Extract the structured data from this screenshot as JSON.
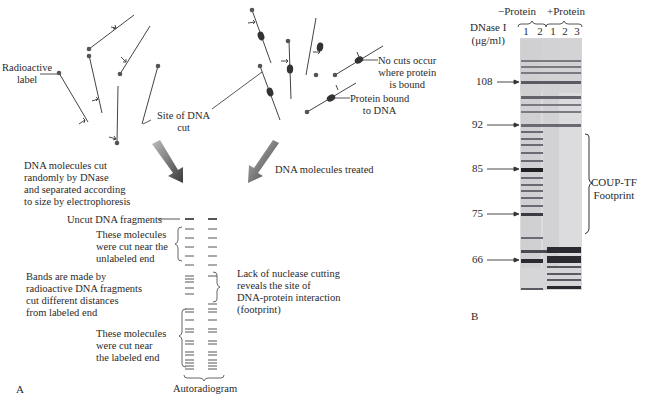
{
  "panel_a": {
    "label": "A",
    "labels": {
      "radioactive": [
        "Radioactive",
        "label"
      ],
      "site_of_cut": [
        "Site of DNA",
        "cut"
      ],
      "no_cuts": [
        "No cuts occur",
        "where protein",
        "is bound"
      ],
      "protein_bound": [
        "Protein bound",
        "to DNA"
      ],
      "dna_cut_randomly": [
        "DNA molecules cut",
        "randomly by DNase",
        "and separated according",
        "to size by electrophoresis"
      ],
      "dna_treated": "DNA molecules treated",
      "uncut": "Uncut DNA fragments",
      "cut_near_unlabeled": [
        "These molecules",
        "were cut near the",
        "unlabeled end"
      ],
      "bands_made_by": [
        "Bands are made by",
        "radioactive DNA fragments",
        "cut different distances",
        "from labeled end"
      ],
      "lack_of_cutting": [
        "Lack of nuclease cutting",
        "reveals the site of",
        "DNA-protein interaction",
        "(footprint)"
      ],
      "cut_near_labeled": [
        "These molecules",
        "were cut near",
        "the labeled end"
      ],
      "autoradiogram": "Autoradiogram"
    }
  },
  "panel_b": {
    "label": "B",
    "group_minus": "−Protein",
    "group_plus": "+Protein",
    "dnase_label": [
      "DNase I",
      "(μg/ml)"
    ],
    "lanes_minus": [
      "1",
      "2"
    ],
    "lanes_plus": [
      "1",
      "2",
      "3"
    ],
    "markers": [
      {
        "label": "108",
        "y": 82
      },
      {
        "label": "92",
        "y": 125
      },
      {
        "label": "85",
        "y": 169
      },
      {
        "label": "75",
        "y": 214
      },
      {
        "label": "66",
        "y": 260
      }
    ],
    "footprint_label": [
      "COUP-TF",
      "Footprint"
    ]
  }
}
